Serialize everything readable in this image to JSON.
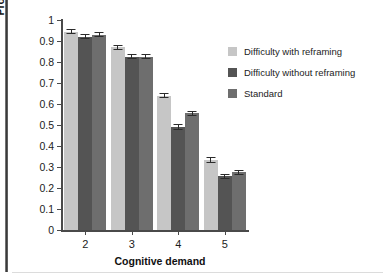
{
  "chart_data": {
    "type": "bar",
    "title": "",
    "xlabel": "Cognitive demand",
    "ylabel": "Proportion of words recalled\n(WM span)",
    "categories": [
      "2",
      "3",
      "4",
      "5"
    ],
    "ylim": [
      0,
      1
    ],
    "yticks": [
      "0",
      "0.1",
      "0.2",
      "0.3",
      "0.4",
      "0.5",
      "0.6",
      "0.7",
      "0.8",
      "0.9",
      "1"
    ],
    "grid": false,
    "legend_position": "right",
    "series": [
      {
        "name": "Difficulty with reframing",
        "color": "#c6c6c6",
        "values": [
          0.945,
          0.87,
          0.64,
          0.335
        ],
        "errors": [
          0.012,
          0.012,
          0.012,
          0.014
        ]
      },
      {
        "name": "Difficulty without reframing",
        "color": "#545454",
        "values": [
          0.92,
          0.825,
          0.49,
          0.255
        ],
        "errors": [
          0.012,
          0.013,
          0.013,
          0.014
        ]
      },
      {
        "name": "Standard",
        "color": "#6e6e6e",
        "values": [
          0.93,
          0.825,
          0.555,
          0.275
        ],
        "errors": [
          0.012,
          0.012,
          0.012,
          0.013
        ]
      }
    ]
  }
}
